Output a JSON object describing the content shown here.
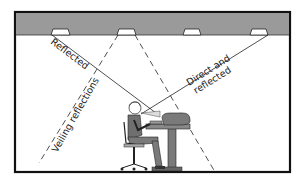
{
  "diagram": {
    "labels": {
      "reflected": "Reflected",
      "direct_and": "Direct and",
      "reflected2": "reflected",
      "veiling": "Veiling reflections"
    },
    "elements": {
      "ceiling": "ceiling",
      "lamps": [
        "ceiling-lamp-1",
        "ceiling-lamp-2",
        "ceiling-lamp-3",
        "ceiling-lamp-4"
      ],
      "person": "seated-worker",
      "workstation": "computer-workstation"
    },
    "colors": {
      "ceiling_fill": "#9a9a9a",
      "line": "#1a1a1a",
      "figure_shade": "#7a7a7a",
      "lamp_fill": "#ffffff"
    }
  }
}
